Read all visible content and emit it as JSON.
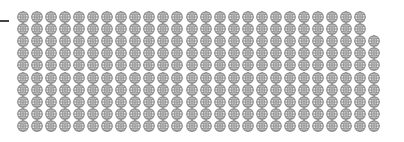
{
  "chart_data": {
    "type": "pictogram",
    "title": "",
    "icon": "globe-icon",
    "icon_color": "#8a8a8a",
    "icon_fill": "#e4e4e4",
    "layout": {
      "columns": 26,
      "rows": 10,
      "fill_order": "column-major, last column filled from bottom",
      "origin_x": 17,
      "origin_y": 8,
      "col_spacing": 14.04,
      "row_spacing": 12.1,
      "icon_size": 12
    },
    "values": [
      258
    ],
    "full_columns": 25,
    "partial_column_count": 8,
    "total_icons": 258,
    "axis_tick": {
      "y": 21,
      "x_from": 0,
      "x_to": 9
    }
  }
}
